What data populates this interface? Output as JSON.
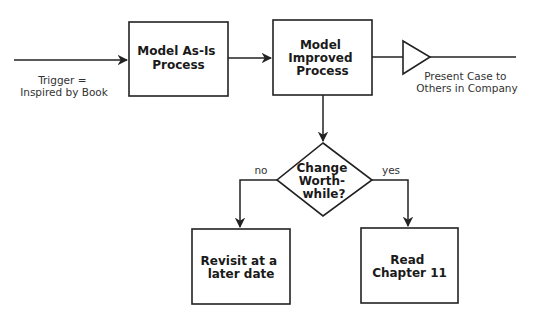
{
  "diagram": {
    "colors": {
      "stroke": "#222222",
      "text": "#1a1a1a",
      "background": "#ffffff"
    },
    "nodes": {
      "model_as_is": {
        "lines": [
          "Model As-Is",
          "Process"
        ]
      },
      "model_improved": {
        "lines": [
          "Model",
          "Improved",
          "Process"
        ]
      },
      "decision": {
        "lines": [
          "Change",
          "Worth-",
          "while?"
        ]
      },
      "revisit": {
        "lines": [
          "Revisit at a",
          "later date"
        ]
      },
      "read_ch11": {
        "lines": [
          "Read",
          "Chapter 11"
        ]
      },
      "present": {
        "shape": "triangle"
      }
    },
    "labels": {
      "trigger": [
        "Trigger =",
        "Inspired by Book"
      ],
      "present_case": [
        "Present Case to",
        "Others in Company"
      ],
      "no": "no",
      "yes": "yes"
    },
    "edges": [
      {
        "from": "trigger",
        "to": "model_as_is"
      },
      {
        "from": "model_as_is",
        "to": "model_improved"
      },
      {
        "from": "model_improved",
        "to": "present"
      },
      {
        "from": "model_improved",
        "to": "decision"
      },
      {
        "from": "decision",
        "to": "revisit",
        "label": "no"
      },
      {
        "from": "decision",
        "to": "read_ch11",
        "label": "yes"
      }
    ]
  }
}
